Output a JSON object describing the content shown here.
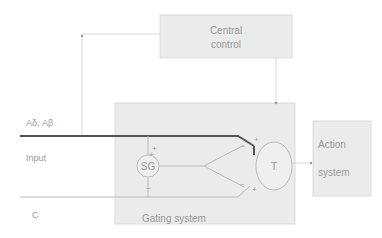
{
  "diagram": {
    "central_control": {
      "line1": "Central",
      "line2": "control"
    },
    "gating_system": {
      "label": "Gating system"
    },
    "action_system": {
      "line1": "Action",
      "line2": "system"
    },
    "sg_cell": {
      "label": "SG"
    },
    "t_cell": {
      "label": "T"
    },
    "inputs": {
      "large_fibers": "Aδ, Aβ",
      "input_label": "Input",
      "small_fibers": "C"
    },
    "signs": {
      "plus": "+",
      "minus": "–"
    },
    "colors": {
      "box_fill": "#ebebeb",
      "box_stroke": "#d8d8d8",
      "thick_line": "#555555",
      "thin_line": "#aaaaaa",
      "text": "#9a9a9a"
    }
  }
}
